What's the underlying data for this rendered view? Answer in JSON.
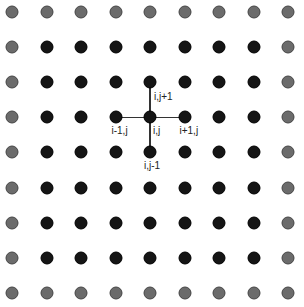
{
  "diagram": {
    "title": "",
    "grid": {
      "rows": 9,
      "cols": 9,
      "origin_x": 12,
      "origin_y": 12,
      "spacing_x": 34.5,
      "spacing_y": 35.1,
      "border_color": "#6b6b6b",
      "interior_color": "#151515"
    },
    "stencil": {
      "center": {
        "col": 4,
        "row": 3
      },
      "labels": {
        "center": "i,j",
        "up": "i,j+1",
        "down": "i,j-1",
        "left": "i-1,j",
        "right": "i+1,j"
      }
    }
  }
}
